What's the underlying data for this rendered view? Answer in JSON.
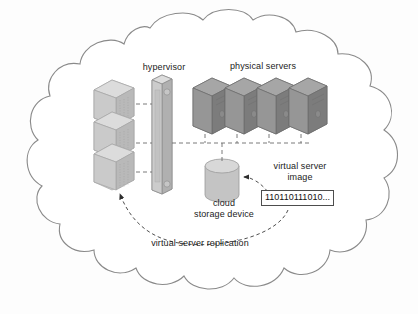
{
  "diagram": {
    "boundary": {
      "shape": "cloud",
      "name": "cloud-boundary",
      "stroke": "#8a8a8a",
      "fill": "#ffffff"
    },
    "labels": {
      "hypervisor": "hypervisor",
      "physical_servers": "physical servers",
      "cloud_storage_device": "cloud\nstorage device",
      "cloud_storage_device_line1": "cloud",
      "cloud_storage_device_line2": "storage device",
      "virtual_server_image": "virtual server\nimage",
      "virtual_server_image_line1": "virtual server",
      "virtual_server_image_line2": "image",
      "virtual_server_replication": "virtual server replication",
      "binary_data": "110110111010..."
    },
    "nodes": [
      {
        "id": "virtual-servers-stack",
        "name": "virtual-servers-stack",
        "type": "isometric-block-stack",
        "count": 3,
        "fill": "#c9c9c9",
        "top_fill": "#d9d9d9",
        "side_fill": "#b4b4b4",
        "stroke": "#9a9a9a"
      },
      {
        "id": "hypervisor",
        "name": "hypervisor-tower",
        "type": "tower",
        "fill": "#c4c4c4",
        "top_fill": "#d6d6d6",
        "side_fill": "#aeaeae",
        "stroke": "#8f8f8f"
      },
      {
        "id": "physical-servers",
        "name": "physical-server",
        "type": "isometric-tower",
        "count": 4,
        "fill": "#8e8e8e",
        "top_fill": "#a0a0a0",
        "side_fill": "#7a7a7a",
        "stroke": "#6e6e6e"
      },
      {
        "id": "cloud-storage-device",
        "name": "cloud-storage-cylinder",
        "type": "cylinder",
        "fill": "#c0c0c0",
        "top_fill": "#d4d4d4",
        "stroke": "#9a9a9a"
      },
      {
        "id": "virtual-server-image",
        "name": "virtual-server-image-box",
        "type": "data-box",
        "value": "110110111010..."
      }
    ],
    "connectors": [
      {
        "name": "vm-to-hypervisor-1",
        "style": "dashed",
        "color": "#6b6b6b"
      },
      {
        "name": "vm-to-hypervisor-2",
        "style": "dashed",
        "color": "#6b6b6b"
      },
      {
        "name": "vm-to-hypervisor-3",
        "style": "dashed",
        "color": "#6b6b6b"
      },
      {
        "name": "hypervisor-to-servers-bus",
        "style": "dashed",
        "color": "#6b6b6b"
      },
      {
        "name": "servers-to-bus-drops",
        "style": "dashed",
        "color": "#6b6b6b",
        "count": 4
      },
      {
        "name": "bus-to-storage",
        "style": "dashed",
        "color": "#6b6b6b"
      },
      {
        "name": "image-to-storage-arrow",
        "style": "dashed-arrow",
        "color": "#3a3a3a"
      },
      {
        "name": "replication-arc-arrow",
        "style": "dashed-arc-arrow",
        "color": "#3a3a3a"
      }
    ]
  }
}
